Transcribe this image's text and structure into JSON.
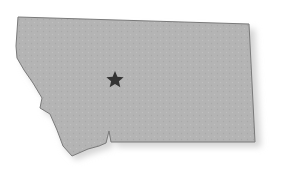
{
  "map": {
    "region": "Montana",
    "fill_color": "#b4b4b4",
    "outline_color": "#7a7a7a",
    "shadow_color": "#d8d8d8",
    "marker": {
      "type": "star",
      "label": "Helena",
      "color": "#333333",
      "x": 115,
      "y": 79
    }
  }
}
